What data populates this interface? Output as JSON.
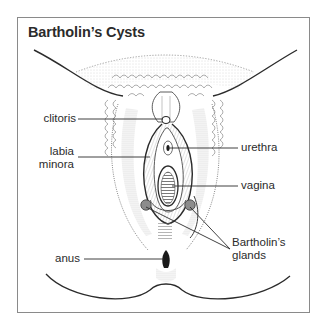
{
  "figure": {
    "title": "Bartholin’s Cysts"
  },
  "labels": {
    "clitoris": "clitoris",
    "labia_minora_line1": "labia",
    "labia_minora_line2": "minora",
    "urethra": "urethra",
    "vagina": "vagina",
    "bartholins_glands_line1": "Bartholin’s",
    "bartholins_glands_line2": "glands",
    "anus": "anus"
  },
  "colors": {
    "line": "#2b2b2b",
    "frame": "#8a8a8a",
    "shading": "#9a9a9a",
    "gland_fill": "#8c8c8c"
  }
}
